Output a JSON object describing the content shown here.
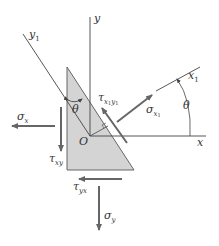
{
  "figure": {
    "type": "stress-element-inclined-plane",
    "colors": {
      "element_fill": "#d4d4d4",
      "element_stroke": "#555555",
      "axis": "#444444",
      "arrow": "#666666",
      "text": "#333333"
    },
    "axes": {
      "x": {
        "label": "x"
      },
      "y": {
        "label": "y"
      },
      "x1": {
        "label": "x",
        "subscript": "1"
      },
      "y1": {
        "label": "y",
        "subscript": "1"
      },
      "origin": {
        "label": "O"
      }
    },
    "angles": {
      "theta_top": "θ",
      "theta_right": "θ"
    },
    "stresses": {
      "sigma_x": {
        "symbol": "σ",
        "subscript": "x"
      },
      "tau_xy": {
        "symbol": "τ",
        "subscript": "xy"
      },
      "tau_yx": {
        "symbol": "τ",
        "subscript": "yx"
      },
      "sigma_y": {
        "symbol": "σ",
        "subscript": "y"
      },
      "sigma_x1": {
        "symbol": "σ",
        "subscript": "x",
        "subsub": "1"
      },
      "tau_x1y1": {
        "symbol": "τ",
        "subscript": "x",
        "subsub": "1",
        "subscript2": "y",
        "subsub2": "1"
      }
    }
  }
}
